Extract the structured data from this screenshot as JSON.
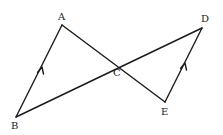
{
  "diagram": {
    "type": "geometry",
    "points": {
      "A": {
        "label": "A",
        "x": 62,
        "y": 25,
        "lx": 58,
        "ly": 20
      },
      "B": {
        "label": "B",
        "x": 16,
        "y": 117,
        "lx": 11,
        "ly": 129
      },
      "C": {
        "label": "C",
        "x": 120,
        "y": 62,
        "lx": 113,
        "ly": 76
      },
      "D": {
        "label": "D",
        "x": 202,
        "y": 28,
        "lx": 201,
        "ly": 22
      },
      "E": {
        "label": "E",
        "x": 165,
        "y": 102,
        "lx": 161,
        "ly": 115
      }
    },
    "segments": [
      {
        "from": "A",
        "to": "B"
      },
      {
        "from": "A",
        "to": "E"
      },
      {
        "from": "B",
        "to": "D"
      },
      {
        "from": "E",
        "to": "D"
      }
    ],
    "parallel_marks": [
      {
        "segment": "BA",
        "tip_x": 42,
        "tip_y": 67
      },
      {
        "segment": "ED",
        "tip_x": 185,
        "tip_y": 63
      }
    ],
    "colors": {
      "line": "#1a1a1a",
      "background": "#ffffff"
    }
  }
}
